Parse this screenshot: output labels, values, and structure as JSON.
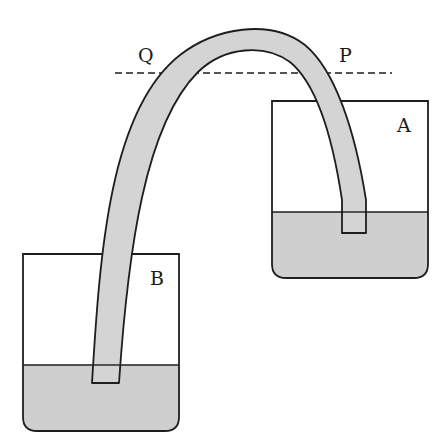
{
  "diagram": {
    "labels": {
      "A": "A",
      "B": "B",
      "P": "P",
      "Q": "Q"
    },
    "colors": {
      "liquid": "#cfcfcf",
      "tube_fill": "#d4d4d4",
      "stroke": "#1e1e1e",
      "background": "#ffffff"
    },
    "elements": {
      "container_a": {
        "x": 272,
        "y": 101,
        "right": 428,
        "bottom": 278,
        "water_level_y": 212
      },
      "container_b": {
        "x": 23,
        "y": 254,
        "right": 179,
        "bottom": 431,
        "water_level_y": 365
      },
      "reference_line": {
        "style": "dashed",
        "y": 73,
        "x1": 115,
        "x2": 392
      },
      "tube": {
        "end_in_a_bottom_y": 233,
        "end_in_b_bottom_y": 383
      }
    }
  }
}
